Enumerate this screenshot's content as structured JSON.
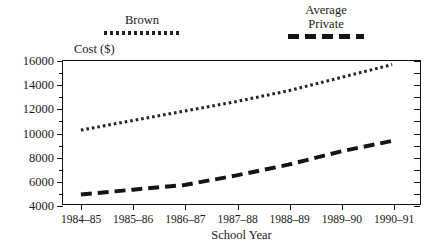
{
  "chart_data": {
    "type": "line",
    "title": "",
    "xlabel": "School Year",
    "ylabel": "Cost ($)",
    "categories": [
      "1984–85",
      "1985–86",
      "1986–87",
      "1987–88",
      "1988–89",
      "1989–90",
      "1990–91"
    ],
    "ylim": [
      4000,
      16000
    ],
    "yticks": [
      4000,
      6000,
      8000,
      10000,
      12000,
      14000,
      16000
    ],
    "ytick_labels": [
      "4000",
      "6000",
      "8000",
      "10000",
      "12000",
      "14000",
      "16000"
    ],
    "grid": false,
    "legend_position": "above-plot",
    "series": [
      {
        "name": "Brown",
        "style": "dotted",
        "color": "#222222",
        "values": [
          10200,
          11000,
          11800,
          12600,
          13500,
          14600,
          15700
        ]
      },
      {
        "name": "Average Private",
        "style": "dashed",
        "color": "#141414",
        "values": [
          4800,
          5200,
          5600,
          6400,
          7300,
          8400,
          9300
        ]
      }
    ]
  },
  "legend": {
    "brown": {
      "label": "Brown",
      "swatch": "dotted-line-swatch"
    },
    "average_private": {
      "line1": "Average",
      "line2": "Private",
      "swatch": "dashed-line-swatch"
    }
  },
  "axes": {
    "y_title": "Cost ($)",
    "x_title": "School Year"
  }
}
